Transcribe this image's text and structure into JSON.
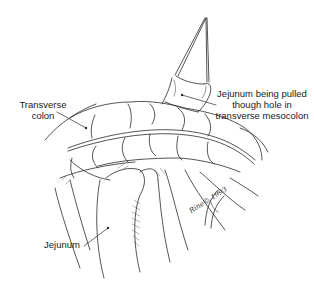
{
  "figure": {
    "type": "surgical illustration",
    "labels": {
      "jejunum_pulled": {
        "line1": "Jejunum being pulled",
        "line2": "though hole in",
        "line3": "transverse mesocolon"
      },
      "transverse_colon": {
        "line1": "Transverse",
        "line2": "colon"
      },
      "jejunum": "Jejunum"
    },
    "signature": "Rine© 1993",
    "colors": {
      "background": "#ffffff",
      "line": "#2a2a2a",
      "text": "#1a1a1a"
    }
  }
}
